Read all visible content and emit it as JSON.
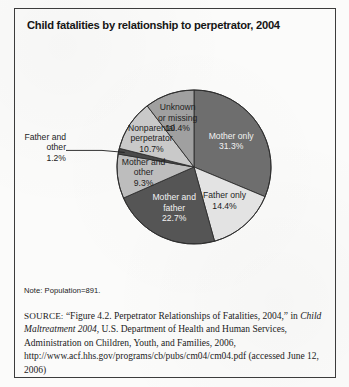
{
  "figure": {
    "title": "Child fatalities by relationship to perpetrator, 2004",
    "note": "Note: Population=891.",
    "source": {
      "label": "SOURCE:",
      "quoted_figure": "“Figure 4.2. Perpetrator Relationships of Fatalities, 2004,” in",
      "publication_italic": "Child Maltreatment 2004",
      "rest": ", U.S. Department of Health and Human Services, Administration on Children, Youth, and Families, 2006, http://www.acf.hhs.gov/programs/cb/pubs/cm04/cm04.pdf (accessed June 12, 2006)"
    }
  },
  "chart_data": {
    "type": "pie",
    "title": "Child fatalities by relationship to perpetrator, 2004",
    "xlabel": "",
    "ylabel": "",
    "legend_position": "none",
    "units": "percent",
    "total_population": 891,
    "start_angle_deg": 0,
    "direction": "clockwise",
    "categories": [
      "Mother only",
      "Father only",
      "Mother and father",
      "Mother and other",
      "Father and other",
      "Nonparental perpetrator",
      "Unknown or missing"
    ],
    "values": [
      31.3,
      14.4,
      22.7,
      9.3,
      1.2,
      10.7,
      10.4
    ],
    "slices": [
      {
        "label": "Mother only",
        "label_line1": "Mother only",
        "label_line2": "31.3%",
        "value": 31.3,
        "value_text": "31.3%",
        "color": "#6e6e6e",
        "text_color": "light",
        "callout": false
      },
      {
        "label": "Father only",
        "label_line1": "Father only",
        "label_line2": "14.4%",
        "value": 14.4,
        "value_text": "14.4%",
        "color": "#e3e3e3",
        "text_color": "dark",
        "callout": false
      },
      {
        "label": "Mother and father",
        "label_line1": "Mother and",
        "label_line2": "father",
        "label_line3": "22.7%",
        "value": 22.7,
        "value_text": "22.7%",
        "color": "#555555",
        "text_color": "light",
        "callout": false
      },
      {
        "label": "Mother and other",
        "label_line1": "Mother and",
        "label_line2": "other",
        "label_line3": "9.3%",
        "value": 9.3,
        "value_text": "9.3%",
        "color": "#bdbdbd",
        "text_color": "dark",
        "callout": false
      },
      {
        "label": "Father and other",
        "label_line1": "Father and",
        "label_line2": "other",
        "label_line3": "1.2%",
        "value": 1.2,
        "value_text": "1.2%",
        "color": "#4a4a4a",
        "text_color": "dark",
        "callout": true
      },
      {
        "label": "Nonparental perpetrator",
        "label_line1": "Nonparental",
        "label_line2": "perpetrator",
        "label_line3": "10.7%",
        "value": 10.7,
        "value_text": "10.7%",
        "color": "#c9c9c9",
        "text_color": "dark",
        "callout": false
      },
      {
        "label": "Unknown or missing",
        "label_line1": "Unknown",
        "label_line2": "or missing",
        "label_line3": "10.4%",
        "value": 10.4,
        "value_text": "10.4%",
        "color": "#a0a0a0",
        "text_color": "dark",
        "callout": false
      }
    ]
  }
}
